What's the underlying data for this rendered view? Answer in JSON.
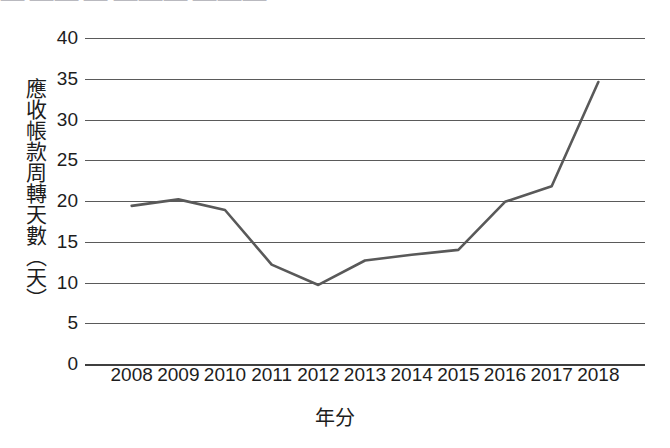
{
  "top_cut_text": "⸺  ⸺⸺  ⸺ ⸺⸺⸺ ⸺⸺⸺",
  "axis": {
    "y_title": "應收帳款周轉天數（天）",
    "x_title": "年分",
    "y_ticks": [
      "40",
      "35",
      "30",
      "25",
      "20",
      "15",
      "10",
      "5",
      "0"
    ],
    "x_ticks": [
      "2008",
      "2009",
      "2010",
      "2011",
      "2012",
      "2013",
      "2014",
      "2015",
      "2016",
      "2017",
      "2018"
    ]
  },
  "style": {
    "line_color": "#595959",
    "grid_color": "#5a5a5a",
    "text_color": "#1d1d1d",
    "background": "#ffffff"
  },
  "chart_data": {
    "type": "line",
    "title": "",
    "subtitle": "",
    "xlabel": "年分",
    "ylabel": "應收帳款周轉天數（天）",
    "x": [
      "2008",
      "2009",
      "2010",
      "2011",
      "2012",
      "2013",
      "2014",
      "2015",
      "2016",
      "2017",
      "2018"
    ],
    "series": [
      {
        "name": "應收帳款周轉天數",
        "values": [
          19.4,
          20.2,
          18.9,
          12.2,
          9.7,
          12.7,
          13.4,
          14.0,
          19.9,
          21.8,
          34.6
        ],
        "color": "#595959"
      }
    ],
    "ylim": [
      0,
      40
    ],
    "ytick_step": 5,
    "grid": "horizontal",
    "legend": "none",
    "markers": "none"
  }
}
